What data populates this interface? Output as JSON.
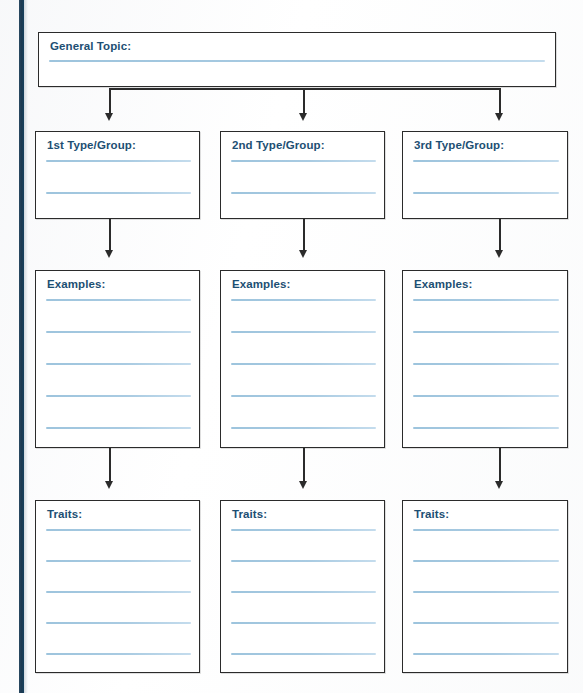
{
  "worksheet": {
    "title": "Graphic Organizer Worksheet",
    "accent_color": "#1d4f73",
    "binding_color": "#1d3a51",
    "rule_color": "#9dc4dd",
    "border_color": "#2b2b2b",
    "background_color": "#ffffff"
  },
  "topic_box": {
    "label": "General Topic:",
    "rule_count": 1
  },
  "columns": [
    {
      "type_box": {
        "label": "1st Type/Group:",
        "rule_count": 2
      },
      "examples_box": {
        "label": "Examples:",
        "rule_count": 5
      },
      "traits_box": {
        "label": "Traits:",
        "rule_count": 5
      }
    },
    {
      "type_box": {
        "label": "2nd Type/Group:",
        "rule_count": 2
      },
      "examples_box": {
        "label": "Examples:",
        "rule_count": 5
      },
      "traits_box": {
        "label": "Traits:",
        "rule_count": 5
      }
    },
    {
      "type_box": {
        "label": "3rd Type/Group:",
        "rule_count": 2
      },
      "examples_box": {
        "label": "Examples:",
        "rule_count": 5
      },
      "traits_box": {
        "label": "Traits:",
        "rule_count": 5
      }
    }
  ],
  "connectors": {
    "arrow_icon": "arrow-down-icon",
    "count": 9
  }
}
